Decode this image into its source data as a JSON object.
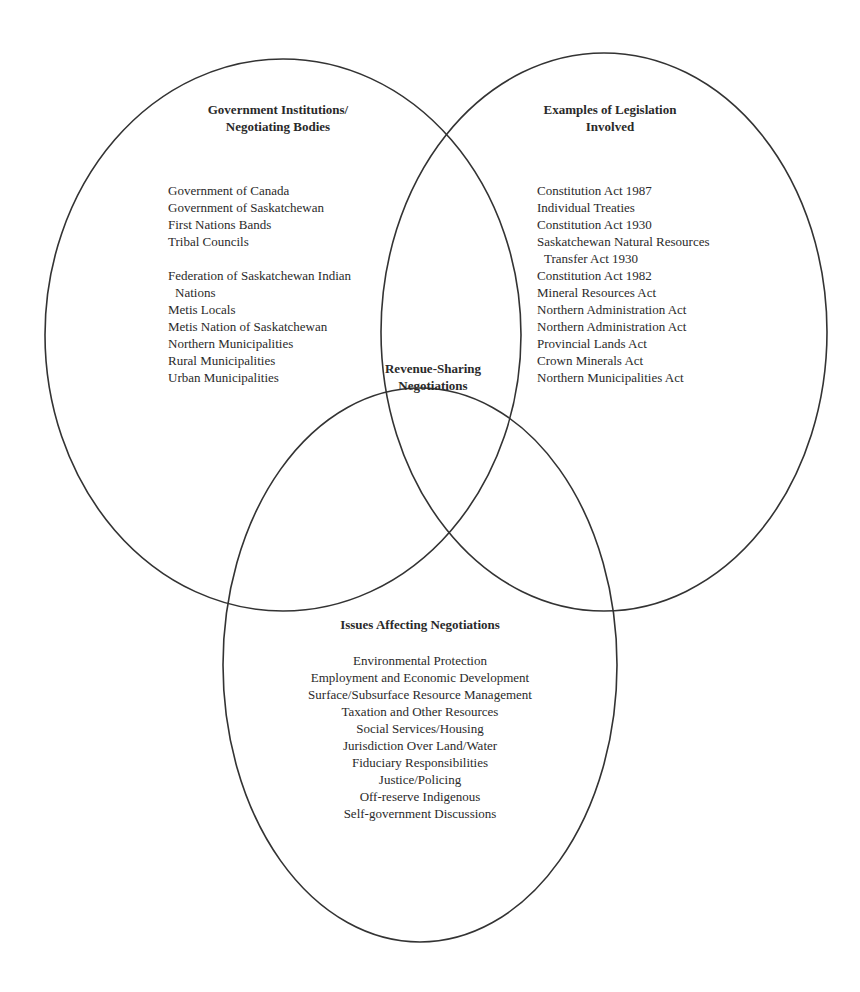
{
  "diagram": {
    "type": "venn",
    "line_color": "#333333",
    "sets": [
      {
        "id": "government",
        "title_lines": [
          "Government Institutions/",
          "Negotiating Bodies"
        ],
        "items": [
          {
            "text": "Government of Canada"
          },
          {
            "text": "Government of Saskatchewan"
          },
          {
            "text": "First Nations Bands"
          },
          {
            "text": "Tribal Councils"
          },
          {
            "text": "Federation of Saskatchewan Indian",
            "gap_before": true
          },
          {
            "text": "Nations",
            "indent": true
          },
          {
            "text": "Metis Locals"
          },
          {
            "text": "Metis Nation of Saskatchewan"
          },
          {
            "text": "Northern Municipalities"
          },
          {
            "text": "Rural Municipalities"
          },
          {
            "text": "Urban Municipalities"
          }
        ]
      },
      {
        "id": "legislation",
        "title_lines": [
          "Examples of Legislation",
          "Involved"
        ],
        "items": [
          {
            "text": "Constitution Act 1987"
          },
          {
            "text": "Individual Treaties"
          },
          {
            "text": "Constitution Act 1930"
          },
          {
            "text": "Saskatchewan Natural Resources"
          },
          {
            "text": "Transfer Act 1930",
            "indent": true
          },
          {
            "text": "Constitution Act 1982"
          },
          {
            "text": "Mineral Resources Act"
          },
          {
            "text": "Northern Administration Act"
          },
          {
            "text": "Northern Administration Act"
          },
          {
            "text": "Provincial Lands Act"
          },
          {
            "text": "Crown Minerals Act"
          },
          {
            "text": "Northern Municipalities Act"
          }
        ]
      },
      {
        "id": "issues",
        "title_lines": [
          "Issues Affecting Negotiations"
        ],
        "items": [
          {
            "text": "Environmental Protection"
          },
          {
            "text": "Employment and Economic Development"
          },
          {
            "text": "Surface/Subsurface Resource Management"
          },
          {
            "text": "Taxation and Other Resources"
          },
          {
            "text": "Social Services/Housing"
          },
          {
            "text": "Jurisdiction Over Land/Water"
          },
          {
            "text": "Fiduciary Responsibilities"
          },
          {
            "text": "Justice/Policing"
          },
          {
            "text": "Off-reserve Indigenous"
          },
          {
            "text": "Self-government Discussions"
          }
        ]
      }
    ],
    "intersection": {
      "title_lines": [
        "Revenue-Sharing",
        "Negotiations"
      ]
    }
  }
}
